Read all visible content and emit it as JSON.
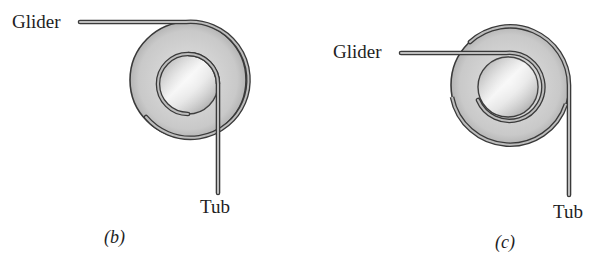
{
  "figure": {
    "panels": [
      {
        "id": "b",
        "caption": "(b)",
        "glider_label": "Glider",
        "tub_label": "Tub",
        "configuration": "string wraps around outer pulley from glider, then around inner hub, hangs down to tub"
      },
      {
        "id": "c",
        "caption": "(c)",
        "glider_label": "Glider",
        "tub_label": "Tub",
        "configuration": "string wraps around inner hub from glider, then around outer pulley, hangs down to tub"
      }
    ],
    "colors": {
      "string_outline": "#3a3a3a",
      "string_fill": "#b9b9b9",
      "pulley_light": "#f2f2f2",
      "pulley_mid": "#cfcfcf",
      "pulley_dark": "#a8a8a8",
      "text": "#1e1e1e",
      "background": "#ffffff"
    }
  }
}
